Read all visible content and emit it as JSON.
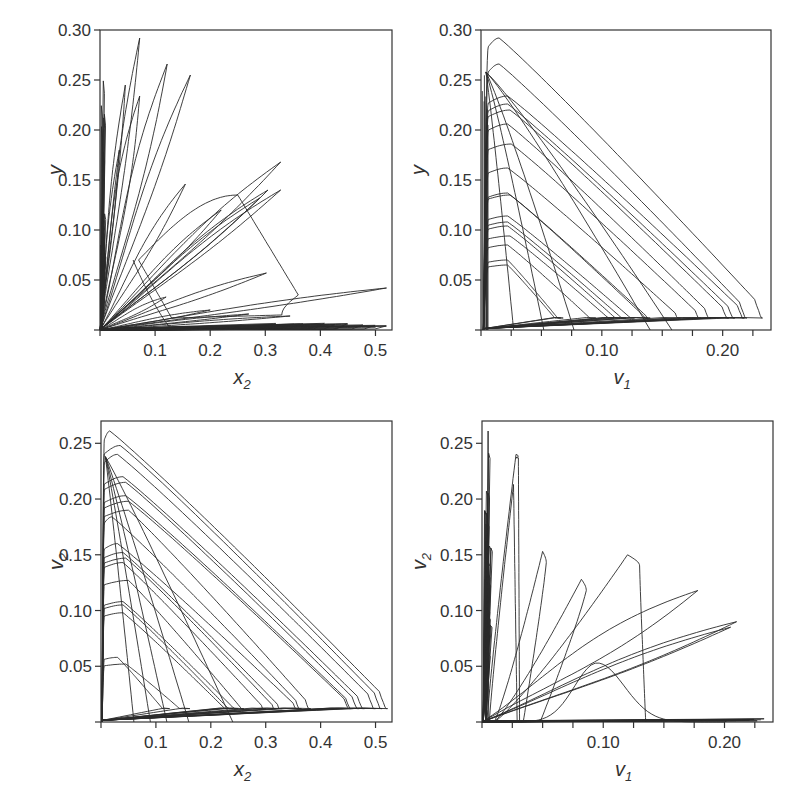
{
  "chart_data": [
    {
      "id": "top-left",
      "type": "line",
      "subtype": "phase-portrait",
      "title": "",
      "xlabel": "x",
      "xlabel_sub": "2",
      "ylabel": "y",
      "ylabel_sub": "",
      "xlim": [
        0,
        0.53
      ],
      "ylim": [
        0,
        0.3
      ],
      "xticks": [
        0.1,
        0.2,
        0.3,
        0.4,
        0.5
      ],
      "xtick_labels": [
        "0.1",
        "0.2",
        "0.3",
        "0.4",
        "0.5"
      ],
      "yticks": [
        0.05,
        0.1,
        0.15,
        0.2,
        0.25,
        0.3
      ],
      "ytick_labels": [
        "0.05",
        "0.10",
        "0.15",
        "0.20",
        "0.25",
        "0.30"
      ],
      "grid": false,
      "legend": null,
      "description": "Fan of elongated loops emanating from origin; peaks near (0.07,0.29), (0.12,0.265), (0.16,0.255), (0.045,0.245), (0.07,0.235), (0.33,0.168), (0.33,0.14), (0.30,0.14), (0.15,0.145), (0.30,0.057), (0.52,0.042); one rounded loop reaching x≈0.36 at y≈0.13",
      "series": [
        {
          "name": "trajectory",
          "x": [
            0.0,
            0.07,
            0.075,
            0.02,
            0.0,
            0.12,
            0.125,
            0.03,
            0.0,
            0.16,
            0.165,
            0.04,
            0.0,
            0.33,
            0.32,
            0.05,
            0.0,
            0.52,
            0.51,
            0.03,
            0.0,
            0.36,
            0.25,
            0.1
          ],
          "y": [
            0.0,
            0.29,
            0.28,
            0.05,
            0.0,
            0.265,
            0.25,
            0.04,
            0.0,
            0.255,
            0.25,
            0.04,
            0.0,
            0.168,
            0.16,
            0.03,
            0.0,
            0.042,
            0.038,
            0.01,
            0.0,
            0.03,
            0.135,
            0.06
          ]
        }
      ]
    },
    {
      "id": "top-right",
      "type": "line",
      "subtype": "phase-portrait",
      "title": "",
      "xlabel": "v",
      "xlabel_sub": "1",
      "ylabel": "y",
      "ylabel_sub": "",
      "xlim": [
        0,
        0.24
      ],
      "ylim": [
        0,
        0.3
      ],
      "xticks": [
        0.1,
        0.2
      ],
      "xtick_labels": [
        "0.10",
        "0.20"
      ],
      "minor_xtick_step": 0.025,
      "yticks": [
        0.05,
        0.1,
        0.15,
        0.2,
        0.25,
        0.3
      ],
      "ytick_labels": [
        "0.05",
        "0.10",
        "0.15",
        "0.20",
        "0.25",
        "0.30"
      ],
      "grid": false,
      "legend": null,
      "description": "Nested triangular loops: rise along v1≈0, arc across top, descend diagonally to lower-right, return along y≈0. Peaks from 0.29 down to 0.065; right extents from 0.07 to 0.233",
      "series": [
        {
          "name": "loop-peaks",
          "x": [
            0.015,
            0.015,
            0.025,
            0.025,
            0.02,
            0.02,
            0.02,
            0.02,
            0.02
          ],
          "y": [
            0.29,
            0.265,
            0.233,
            0.22,
            0.185,
            0.16,
            0.135,
            0.11,
            0.07
          ]
        },
        {
          "name": "loop-right-extent",
          "x": [
            0.233,
            0.22,
            0.21,
            0.19,
            0.18,
            0.14,
            0.13,
            0.115,
            0.07
          ],
          "y": [
            0.02,
            0.02,
            0.02,
            0.02,
            0.02,
            0.02,
            0.02,
            0.02,
            0.02
          ]
        }
      ]
    },
    {
      "id": "bottom-left",
      "type": "line",
      "subtype": "phase-portrait",
      "title": "",
      "xlabel": "x",
      "xlabel_sub": "2",
      "ylabel": "v",
      "ylabel_sub": "2",
      "xlim": [
        0,
        0.53
      ],
      "ylim": [
        0,
        0.27
      ],
      "xticks": [
        0.1,
        0.2,
        0.3,
        0.4,
        0.5
      ],
      "xtick_labels": [
        "0.1",
        "0.2",
        "0.3",
        "0.4",
        "0.5"
      ],
      "yticks": [
        0.05,
        0.1,
        0.15,
        0.2,
        0.25
      ],
      "ytick_labels": [
        "0.05",
        "0.10",
        "0.15",
        "0.20",
        "0.25"
      ],
      "grid": false,
      "legend": null,
      "description": "Nested triangular loops in (x2, v2); peaks from 0.26 down to 0.05; right extents from 0.16 to 0.52",
      "series": [
        {
          "name": "loop-peaks",
          "x": [
            0.015,
            0.03,
            0.03,
            0.04,
            0.04,
            0.05,
            0.04,
            0.04,
            0.04,
            0.05
          ],
          "y": [
            0.26,
            0.248,
            0.22,
            0.215,
            0.2,
            0.19,
            0.15,
            0.125,
            0.105,
            0.052
          ]
        },
        {
          "name": "loop-right-extent",
          "x": [
            0.52,
            0.51,
            0.48,
            0.46,
            0.38,
            0.36,
            0.33,
            0.3,
            0.24,
            0.16
          ],
          "y": [
            0.01,
            0.01,
            0.01,
            0.01,
            0.01,
            0.01,
            0.01,
            0.01,
            0.01,
            0.01
          ]
        }
      ]
    },
    {
      "id": "bottom-right",
      "type": "line",
      "subtype": "phase-portrait",
      "title": "",
      "xlabel": "v",
      "xlabel_sub": "1",
      "ylabel": "v",
      "ylabel_sub": "2",
      "xlim": [
        0,
        0.24
      ],
      "ylim": [
        0,
        0.27
      ],
      "xticks": [
        0.1,
        0.2
      ],
      "xtick_labels": [
        "0.10",
        "0.20"
      ],
      "minor_xtick_step": 0.025,
      "yticks": [
        0.05,
        0.1,
        0.15,
        0.2,
        0.25
      ],
      "ytick_labels": [
        "0.05",
        "0.10",
        "0.15",
        "0.20",
        "0.25"
      ],
      "grid": false,
      "legend": null,
      "description": "Fan of tilted loops from origin; tips near (0.03,0.24), (0.027,0.213), (0.052,0.153), (0.085,0.128), (0.12,0.15), (0.18,0.118), (0.21,0.09); bump peaking at (0.095,0.053); dense spike at v1≈0.005 up to 0.26",
      "series": [
        {
          "name": "loop-tips",
          "x": [
            0.005,
            0.03,
            0.027,
            0.052,
            0.085,
            0.12,
            0.18,
            0.21,
            0.095
          ],
          "y": [
            0.26,
            0.24,
            0.213,
            0.153,
            0.128,
            0.15,
            0.118,
            0.09,
            0.053
          ]
        }
      ]
    }
  ]
}
